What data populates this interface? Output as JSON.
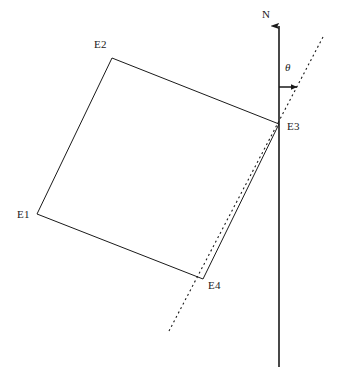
{
  "diagram": {
    "type": "geometry-diagram",
    "width": 338,
    "height": 386,
    "background_color": "#ffffff",
    "stroke_color": "#1a1a1a",
    "axis": {
      "label": "N",
      "label_x": 262,
      "label_y": 9,
      "line_x": 279,
      "line_top_y": 26,
      "line_bottom_y": 367,
      "arrowhead": "up-arrow-icon",
      "stroke_width": 1.6
    },
    "angle": {
      "symbol": "θ",
      "label_x": 285,
      "label_y": 62,
      "indicator_arrow": {
        "from_x": 279,
        "from_y": 87,
        "to_x": 297,
        "to_y": 87
      }
    },
    "dashed_line": {
      "x1": 323,
      "y1": 37,
      "x2": 169,
      "y2": 331,
      "dash_pattern": "2 3",
      "stroke_width": 1.1
    },
    "quadrilateral": {
      "stroke_width": 1.0,
      "fill": "none",
      "vertices": [
        {
          "id": "E1",
          "x": 37,
          "y": 214,
          "label": "E1",
          "label_x": 17,
          "label_y": 209
        },
        {
          "id": "E2",
          "x": 112,
          "y": 58,
          "label": "E2",
          "label_x": 94,
          "label_y": 39
        },
        {
          "id": "E3",
          "x": 279,
          "y": 124,
          "label": "E3",
          "label_x": 287,
          "label_y": 121
        },
        {
          "id": "E4",
          "x": 203,
          "y": 279,
          "label": "E4",
          "label_x": 208,
          "label_y": 280
        }
      ],
      "edges": [
        {
          "from": "E1",
          "to": "E2"
        },
        {
          "from": "E2",
          "to": "E3"
        },
        {
          "from": "E3",
          "to": "E4"
        },
        {
          "from": "E4",
          "to": "E1"
        }
      ]
    }
  }
}
